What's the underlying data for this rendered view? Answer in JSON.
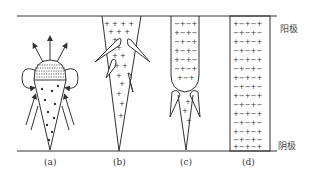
{
  "figure": {
    "panels": [
      {
        "id": "a",
        "label": "(a)",
        "description": "cone streamer with dotted head, outward arrows and side field loops"
      },
      {
        "id": "b",
        "label": "(b)",
        "description": "cathode-directed streamer, positive charge filled cone with side avalanches"
      },
      {
        "id": "c",
        "label": "(c)",
        "description": "mixed +/- channel with positive cone tip and side avalanches"
      },
      {
        "id": "d",
        "label": "(d)",
        "description": "full plasma channel filled with alternating + and - charges"
      }
    ],
    "electrodes": {
      "anode": "阳极",
      "cathode": "阴极"
    },
    "charge_symbols": {
      "positive": "+",
      "negative": "−"
    },
    "colors": {
      "line": "#333333",
      "background": "#ffffff"
    }
  }
}
